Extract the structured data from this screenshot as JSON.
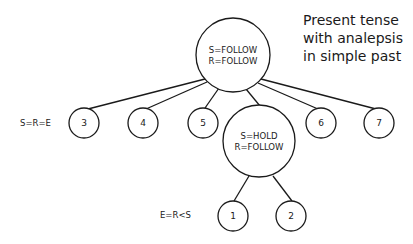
{
  "title": {
    "lines": [
      "Present tense",
      "with analepsis",
      "in simple past"
    ]
  },
  "root": {
    "line1": "S=FOLLOW",
    "line2": "R=FOLLOW"
  },
  "hold_node": {
    "line1": "S=HOLD",
    "line2": "R=FOLLOW"
  },
  "level1_label": "S=R=E",
  "level2_label": "E=R<S",
  "leaf_nodes": {
    "n3": "3",
    "n4": "4",
    "n5": "5",
    "n6": "6",
    "n7": "7",
    "n1": "1",
    "n2": "2"
  }
}
